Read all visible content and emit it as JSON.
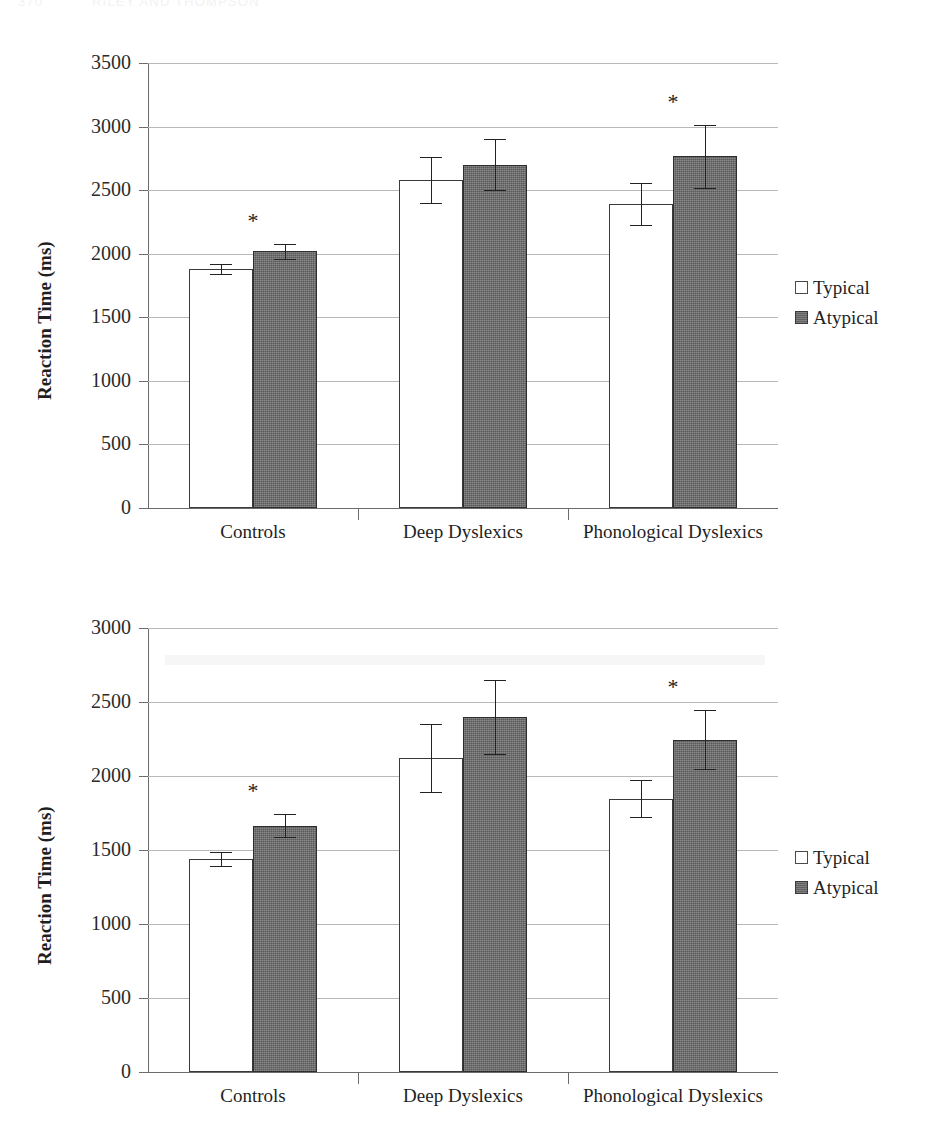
{
  "running_head": {
    "page_number": "370",
    "title": "RILEY AND THOMPSON"
  },
  "legend": {
    "items": [
      {
        "label": "Typical",
        "swatch": "open-square",
        "color": "#ffffff"
      },
      {
        "label": "Atypical",
        "swatch": "filled-square",
        "color": "#6e6e6e"
      }
    ]
  },
  "colors": {
    "typical_fill": "#ffffff",
    "atypical_fill": "#6e6e6e",
    "axis": "#6b6b6b",
    "grid": "#b8b8b8",
    "text": "#1f1f1f"
  },
  "chart_data": [
    {
      "type": "bar",
      "id": "chart-top",
      "title": "",
      "xlabel": "",
      "ylabel": "Reaction Time (ms)",
      "ylim": [
        0,
        3500
      ],
      "ytick_step": 500,
      "ytick_labels": [
        "3500",
        "3000",
        "2500",
        "2000",
        "1500",
        "1000",
        "500",
        "0"
      ],
      "grid": true,
      "legend_position": "right",
      "categories": [
        "Controls",
        "Deep Dyslexics",
        "Phonological Dyslexics"
      ],
      "series": [
        {
          "name": "Typical",
          "values": [
            1880,
            2580,
            2390
          ],
          "errors": [
            40,
            180,
            165
          ]
        },
        {
          "name": "Atypical",
          "values": [
            2020,
            2700,
            2765
          ],
          "errors": [
            60,
            200,
            245
          ]
        }
      ],
      "annotations": [
        {
          "category": "Controls",
          "text": "*",
          "meaning": "significant"
        },
        {
          "category": "Phonological Dyslexics",
          "text": "*",
          "meaning": "significant"
        }
      ]
    },
    {
      "type": "bar",
      "id": "chart-bottom",
      "title": "",
      "xlabel": "",
      "ylabel": "Reaction Time (ms)",
      "ylim": [
        0,
        3000
      ],
      "ytick_step": 500,
      "ytick_labels": [
        "3000",
        "2500",
        "2000",
        "1500",
        "1000",
        "500",
        "0"
      ],
      "grid": true,
      "legend_position": "right",
      "categories": [
        "Controls",
        "Deep Dyslexics",
        "Phonological Dyslexics"
      ],
      "series": [
        {
          "name": "Typical",
          "values": [
            1440,
            2120,
            1845
          ],
          "errors": [
            45,
            230,
            125
          ]
        },
        {
          "name": "Atypical",
          "values": [
            1665,
            2400,
            2245
          ],
          "errors": [
            75,
            250,
            200
          ]
        }
      ],
      "annotations": [
        {
          "category": "Controls",
          "text": "*",
          "meaning": "significant"
        },
        {
          "category": "Phonological Dyslexics",
          "text": "*",
          "meaning": "significant"
        }
      ]
    }
  ]
}
